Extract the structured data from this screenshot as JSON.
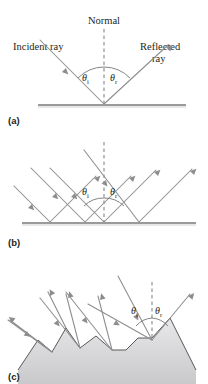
{
  "figure": {
    "title_text": "",
    "panels": [
      {
        "id": "a",
        "part_label": "(a)",
        "caption_concept": "Law of reflection for a single ray",
        "labels": {
          "normal": "Normal",
          "incident_ray": "Incident ray",
          "reflected_ray_line1": "Reflected",
          "reflected_ray_line2": "ray",
          "theta_i_symbol": "θ",
          "theta_i_sub": "i",
          "theta_r_symbol": "θ",
          "theta_r_sub": "r"
        },
        "ray_count_incident": 1,
        "ray_count_reflected": 1,
        "surface_type": "smooth"
      },
      {
        "id": "b",
        "part_label": "(b)",
        "caption_concept": "Specular reflection from a smooth surface",
        "labels": {
          "theta_i_symbol": "θ",
          "theta_i_sub": "i",
          "theta_r_symbol": "θ",
          "theta_r_sub": "r"
        },
        "ray_count_incident": 4,
        "ray_count_reflected": 4,
        "surface_type": "smooth"
      },
      {
        "id": "c",
        "part_label": "(c)",
        "caption_concept": "Diffuse reflection from a rough surface",
        "labels": {
          "theta_i_symbol": "θ",
          "theta_i_sub": "i",
          "theta_r_symbol": "θ",
          "theta_r_sub": "r"
        },
        "ray_count_incident": 5,
        "ray_count_reflected": 5,
        "surface_type": "rough"
      }
    ]
  },
  "colors": {
    "ray": "#8d8c8e",
    "surface": "#9a999b",
    "rough_outline": "#58575a",
    "text": "#231f20",
    "background": "#ffffff",
    "shadow_fill": "#d9d9db"
  }
}
